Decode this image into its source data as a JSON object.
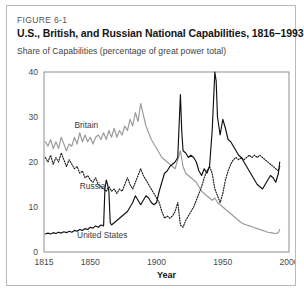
{
  "figure": {
    "number": "FIGURE 6-1",
    "title": "U.S., British, and Russian National Capabilities, 1816–1993",
    "subtitle": "Share of Capabilities (percentage of great power total)"
  },
  "colors": {
    "united_states": "#111111",
    "britain": "#9a9a9a",
    "russia": "#1a1a1a",
    "frame": "#8f8f8f",
    "card_border": "#b9b9b9",
    "text": "#151515",
    "tick_text": "#4a4a4a"
  },
  "chart_data": {
    "type": "line",
    "title": "U.S., British, and Russian National Capabilities, 1816–1993",
    "subtitle": "Share of Capabilities (percentage of great power total)",
    "xlabel": "Year",
    "ylabel": "",
    "xlim": [
      1815,
      2000
    ],
    "ylim": [
      0,
      40
    ],
    "xticks": [
      1815,
      1850,
      1900,
      1950,
      2000
    ],
    "yticks": [
      0,
      10,
      20,
      30,
      40
    ],
    "grid": false,
    "legend": "inline-labels",
    "series": [
      {
        "name": "Britain",
        "style": "solid",
        "color": "#9a9a9a",
        "label_x": 1838,
        "label_y": 27.5,
        "x": [
          1816,
          1818,
          1820,
          1822,
          1824,
          1826,
          1828,
          1830,
          1832,
          1834,
          1836,
          1838,
          1840,
          1842,
          1844,
          1846,
          1848,
          1850,
          1852,
          1854,
          1856,
          1858,
          1860,
          1862,
          1864,
          1866,
          1868,
          1870,
          1872,
          1874,
          1876,
          1878,
          1880,
          1882,
          1884,
          1886,
          1888,
          1890,
          1892,
          1894,
          1896,
          1898,
          1900,
          1902,
          1904,
          1906,
          1908,
          1910,
          1912,
          1914,
          1916,
          1918,
          1920,
          1922,
          1924,
          1926,
          1928,
          1930,
          1932,
          1934,
          1936,
          1938,
          1940,
          1942,
          1944,
          1946,
          1948,
          1950,
          1952,
          1954,
          1956,
          1958,
          1960,
          1962,
          1964,
          1966,
          1968,
          1970,
          1972,
          1974,
          1976,
          1978,
          1980,
          1982,
          1984,
          1986,
          1988,
          1990,
          1992,
          1993
        ],
        "values": [
          24.5,
          23.5,
          25.0,
          23.0,
          24.5,
          23.0,
          25.5,
          24.0,
          22.5,
          24.0,
          23.5,
          25.5,
          24.0,
          26.5,
          24.5,
          26.0,
          24.5,
          25.5,
          24.0,
          25.5,
          26.0,
          25.0,
          26.5,
          25.0,
          27.0,
          25.5,
          27.5,
          25.5,
          27.0,
          26.0,
          28.0,
          27.0,
          29.5,
          28.0,
          31.0,
          29.0,
          33.0,
          30.5,
          28.0,
          26.5,
          25.0,
          24.0,
          23.0,
          22.0,
          21.0,
          20.5,
          20.0,
          19.5,
          19.0,
          18.5,
          20.5,
          22.5,
          19.0,
          17.5,
          17.0,
          16.5,
          16.0,
          15.5,
          14.5,
          13.5,
          13.0,
          12.5,
          12.0,
          11.5,
          12.0,
          11.0,
          10.5,
          10.0,
          9.5,
          9.0,
          8.5,
          8.0,
          7.5,
          7.0,
          6.5,
          6.2,
          6.0,
          5.8,
          5.6,
          5.4,
          5.2,
          5.0,
          4.8,
          4.6,
          4.4,
          4.3,
          4.2,
          4.1,
          4.3,
          5.0
        ]
      },
      {
        "name": "Russia",
        "style": "dotted",
        "color": "#1a1a1a",
        "label_x": 1842,
        "label_y": 14.0,
        "x": [
          1816,
          1818,
          1820,
          1822,
          1824,
          1826,
          1828,
          1830,
          1832,
          1834,
          1836,
          1838,
          1840,
          1842,
          1844,
          1846,
          1848,
          1850,
          1852,
          1854,
          1856,
          1858,
          1860,
          1862,
          1864,
          1866,
          1868,
          1870,
          1872,
          1874,
          1876,
          1878,
          1880,
          1882,
          1884,
          1886,
          1888,
          1890,
          1892,
          1894,
          1896,
          1898,
          1900,
          1902,
          1904,
          1906,
          1908,
          1910,
          1912,
          1914,
          1916,
          1918,
          1920,
          1922,
          1924,
          1926,
          1928,
          1930,
          1932,
          1934,
          1936,
          1938,
          1940,
          1942,
          1944,
          1946,
          1948,
          1950,
          1952,
          1954,
          1956,
          1958,
          1960,
          1962,
          1964,
          1966,
          1968,
          1970,
          1972,
          1974,
          1976,
          1978,
          1980,
          1982,
          1984,
          1986,
          1988,
          1990,
          1992,
          1993
        ],
        "values": [
          21.0,
          20.0,
          21.5,
          19.5,
          21.0,
          20.0,
          22.0,
          20.5,
          19.0,
          20.5,
          19.5,
          18.5,
          19.0,
          17.5,
          18.0,
          16.5,
          17.0,
          16.0,
          15.5,
          16.5,
          15.0,
          14.5,
          14.0,
          13.5,
          14.5,
          13.5,
          14.0,
          13.0,
          14.0,
          13.5,
          15.0,
          16.5,
          15.0,
          14.0,
          15.5,
          17.0,
          18.5,
          17.0,
          16.0,
          15.0,
          14.0,
          13.0,
          12.0,
          11.0,
          9.0,
          7.5,
          8.0,
          7.5,
          8.0,
          9.0,
          11.0,
          6.0,
          5.5,
          7.0,
          8.0,
          9.0,
          10.0,
          11.5,
          13.0,
          14.5,
          16.5,
          18.0,
          19.0,
          17.5,
          14.0,
          12.5,
          11.0,
          13.0,
          16.0,
          18.0,
          19.5,
          20.5,
          21.0,
          20.5,
          21.0,
          20.5,
          21.0,
          21.5,
          21.0,
          21.5,
          21.0,
          21.5,
          21.0,
          20.5,
          20.0,
          19.5,
          19.0,
          18.5,
          18.0,
          19.0
        ]
      },
      {
        "name": "United States",
        "style": "solid",
        "color": "#111111",
        "label_x": 1840,
        "label_y": 3.2,
        "x": [
          1816,
          1818,
          1820,
          1822,
          1824,
          1826,
          1828,
          1830,
          1832,
          1834,
          1836,
          1838,
          1840,
          1842,
          1844,
          1846,
          1848,
          1850,
          1852,
          1854,
          1856,
          1858,
          1860,
          1861,
          1862,
          1863,
          1864,
          1865,
          1866,
          1868,
          1870,
          1872,
          1874,
          1876,
          1878,
          1880,
          1882,
          1884,
          1886,
          1888,
          1890,
          1892,
          1894,
          1896,
          1898,
          1900,
          1902,
          1904,
          1906,
          1908,
          1910,
          1912,
          1914,
          1916,
          1917,
          1918,
          1919,
          1920,
          1922,
          1924,
          1926,
          1928,
          1930,
          1932,
          1934,
          1936,
          1938,
          1940,
          1942,
          1944,
          1945,
          1946,
          1948,
          1950,
          1952,
          1954,
          1956,
          1958,
          1960,
          1962,
          1964,
          1966,
          1968,
          1970,
          1972,
          1974,
          1976,
          1978,
          1980,
          1982,
          1984,
          1986,
          1988,
          1990,
          1992,
          1993
        ],
        "values": [
          4.0,
          4.2,
          4.0,
          4.3,
          4.1,
          4.4,
          4.2,
          4.5,
          4.3,
          4.6,
          4.4,
          4.8,
          4.6,
          5.0,
          4.8,
          5.2,
          5.0,
          5.5,
          5.3,
          5.8,
          5.5,
          6.0,
          5.8,
          14.0,
          16.0,
          15.0,
          13.5,
          6.5,
          6.0,
          6.5,
          7.0,
          7.5,
          8.0,
          8.5,
          9.0,
          10.0,
          11.0,
          12.5,
          11.5,
          10.5,
          11.5,
          12.5,
          12.0,
          11.0,
          10.5,
          11.0,
          13.5,
          15.5,
          17.5,
          18.0,
          19.0,
          19.5,
          20.0,
          21.0,
          28.0,
          35.0,
          27.0,
          22.5,
          22.0,
          21.0,
          21.5,
          21.0,
          20.0,
          18.0,
          17.0,
          18.5,
          17.5,
          19.0,
          27.0,
          40.0,
          38.0,
          30.0,
          26.0,
          29.5,
          27.5,
          25.0,
          24.5,
          23.5,
          22.5,
          21.5,
          21.0,
          20.0,
          19.0,
          18.0,
          17.0,
          16.0,
          15.0,
          14.5,
          14.0,
          15.0,
          16.0,
          17.0,
          16.5,
          15.5,
          17.5,
          20.0
        ]
      }
    ]
  }
}
